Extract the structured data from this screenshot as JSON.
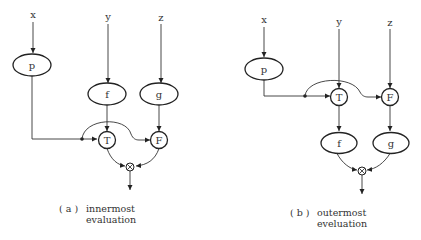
{
  "diagram_a": {
    "inputs": {
      "x": "x",
      "y": "y",
      "z": "z"
    },
    "nodes": {
      "p": "p",
      "f": "f",
      "g": "g",
      "T": "T",
      "F": "F",
      "merge": "⊗"
    },
    "caption": {
      "label": "( a )",
      "line1": "innermost",
      "line2": "evaluation"
    }
  },
  "diagram_b": {
    "inputs": {
      "x": "x",
      "y": "y",
      "z": "z"
    },
    "nodes": {
      "p": "p",
      "f": "f",
      "g": "g",
      "T": "T",
      "F": "F",
      "merge": "⊗"
    },
    "caption": {
      "label": "( b )",
      "line1": "outermost",
      "line2": "eveluation"
    }
  }
}
